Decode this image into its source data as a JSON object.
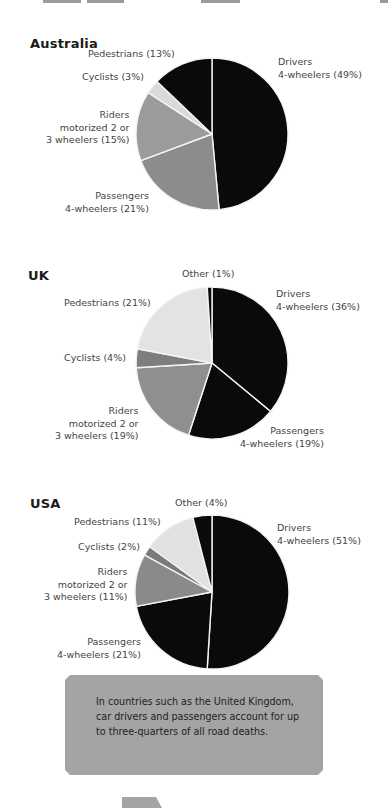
{
  "chart_data": [
    {
      "type": "pie",
      "title": "Australia",
      "start_angle": "12 o'clock, clockwise",
      "slices": [
        {
          "label": "Drivers 4-wheelers",
          "value": 49,
          "color": "#0a0a0a"
        },
        {
          "label": "Passengers 4-wheelers",
          "value": 21,
          "color": "#8c8c8c"
        },
        {
          "label": "Riders motorized 2 or 3 wheelers",
          "value": 15,
          "color": "#9b9b9b"
        },
        {
          "label": "Cyclists",
          "value": 3,
          "color": "#dadada"
        },
        {
          "label": "Pedestrians",
          "value": 13,
          "color": "#0a0a0a"
        }
      ]
    },
    {
      "type": "pie",
      "title": "UK",
      "start_angle": "12 o'clock, clockwise",
      "slices": [
        {
          "label": "Drivers 4-wheelers",
          "value": 36,
          "color": "#0a0a0a"
        },
        {
          "label": "Passengers 4-wheelers",
          "value": 19,
          "color": "#0a0a0a"
        },
        {
          "label": "Riders motorized 2 or 3 wheelers",
          "value": 19,
          "color": "#8f8f8f"
        },
        {
          "label": "Cyclists",
          "value": 4,
          "color": "#7e7e7e"
        },
        {
          "label": "Pedestrians",
          "value": 21,
          "color": "#e3e3e3"
        },
        {
          "label": "Other",
          "value": 1,
          "color": "#0a0a0a"
        }
      ]
    },
    {
      "type": "pie",
      "title": "USA",
      "start_angle": "12 o'clock, clockwise",
      "slices": [
        {
          "label": "Drivers 4-wheelers",
          "value": 51,
          "color": "#0a0a0a"
        },
        {
          "label": "Passengers 4-wheelers",
          "value": 21,
          "color": "#0a0a0a"
        },
        {
          "label": "Riders motorized 2 or 3 wheelers",
          "value": 11,
          "color": "#8a8a8a"
        },
        {
          "label": "Cyclists",
          "value": 2,
          "color": "#7a7a7a"
        },
        {
          "label": "Pedestrians",
          "value": 11,
          "color": "#e1e1e1"
        },
        {
          "label": "Other",
          "value": 4,
          "color": "#0a0a0a"
        }
      ]
    }
  ],
  "australia": {
    "title": "Australia",
    "labels": {
      "drivers": [
        "Drivers",
        "4-wheelers (49%)"
      ],
      "passengers": [
        "Passengers",
        "4-wheelers (21%)"
      ],
      "riders": [
        "Riders",
        "motorized 2 or",
        "3 wheelers (15%)"
      ],
      "cyclists": [
        "Cyclists (3%)"
      ],
      "pedestrians": [
        "Pedestrians (13%)"
      ]
    }
  },
  "uk": {
    "title": "UK",
    "labels": {
      "drivers": [
        "Drivers",
        "4-wheelers (36%)"
      ],
      "passengers": [
        "Passengers",
        "4-wheelers (19%)"
      ],
      "riders": [
        "Riders",
        "motorized 2 or",
        "3 wheelers (19%)"
      ],
      "cyclists": [
        "Cyclists (4%)"
      ],
      "pedestrians": [
        "Pedestrians (21%)"
      ],
      "other": [
        "Other (1%)"
      ]
    }
  },
  "usa": {
    "title": "USA",
    "labels": {
      "drivers": [
        "Drivers",
        "4-wheelers (51%)"
      ],
      "passengers": [
        "Passengers",
        "4-wheelers (21%)"
      ],
      "riders": [
        "Riders",
        "motorized 2 or",
        "3 wheelers (11%)"
      ],
      "cyclists": [
        "Cyclists (2%)"
      ],
      "pedestrians": [
        "Pedestrians (11%)"
      ],
      "other": [
        "Other (4%)"
      ]
    }
  },
  "callout": {
    "lines": [
      "In countries such as the United Kingdom,",
      "car drivers and passengers account for up",
      "to three-quarters of all road deaths."
    ]
  }
}
